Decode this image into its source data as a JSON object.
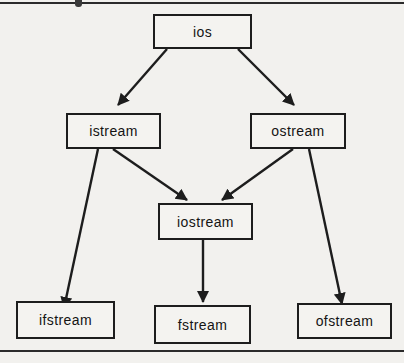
{
  "page": {
    "background_color": "#f2f1ee",
    "line_color": "#1d1d1d"
  },
  "diagram": {
    "nodes": [
      {
        "id": "ios",
        "label": "ios"
      },
      {
        "id": "istream",
        "label": "istream"
      },
      {
        "id": "ostream",
        "label": "ostream"
      },
      {
        "id": "iostream",
        "label": "iostream"
      },
      {
        "id": "ifstream",
        "label": "ifstream"
      },
      {
        "id": "fstream",
        "label": "fstream"
      },
      {
        "id": "ofstream",
        "label": "ofstream"
      }
    ],
    "edges": [
      {
        "from": "ios",
        "to": "istream"
      },
      {
        "from": "ios",
        "to": "ostream"
      },
      {
        "from": "istream",
        "to": "iostream"
      },
      {
        "from": "ostream",
        "to": "iostream"
      },
      {
        "from": "istream",
        "to": "ifstream"
      },
      {
        "from": "ostream",
        "to": "ofstream"
      },
      {
        "from": "iostream",
        "to": "fstream"
      }
    ]
  }
}
